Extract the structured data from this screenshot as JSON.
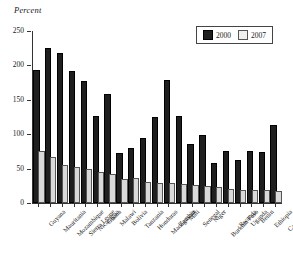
{
  "chart_data": {
    "type": "bar",
    "title": "",
    "ylabel": "Percent",
    "xlabel": "",
    "ylim": [
      0,
      250
    ],
    "yticks": [
      0,
      50,
      100,
      150,
      200,
      250
    ],
    "grid": false,
    "legend_position": "top-right",
    "categories": [
      "Guyana",
      "Mauritania",
      "Mozambique",
      "Sierra Leone",
      "Nicaragua",
      "Ghana",
      "Malawi",
      "Bolivia",
      "Tanzania",
      "Honduras",
      "Madagascar",
      "Zambia",
      "Mali",
      "Senegal",
      "Niger",
      "Burkina Faso",
      "Rwanda",
      "Uganda",
      "Benin",
      "Ethiopia",
      "Cameroon"
    ],
    "series": [
      {
        "name": "2000",
        "color": "#1f1f1f",
        "values": [
          190,
          222,
          215,
          189,
          175,
          123,
          155,
          70,
          77,
          91,
          122,
          176,
          124,
          83,
          96,
          55,
          73,
          60,
          72,
          71,
          110
        ]
      },
      {
        "name": "2007",
        "color": "#d9d9d9",
        "values": [
          72,
          64,
          53,
          50,
          46,
          42,
          39,
          32,
          33,
          27,
          26,
          26,
          25,
          24,
          22,
          20,
          17,
          16,
          16,
          16,
          15
        ]
      }
    ]
  },
  "legend": {
    "entries": [
      {
        "label": "2000",
        "swatch": "dark-swatch"
      },
      {
        "label": "2007",
        "swatch": "light-swatch"
      }
    ]
  }
}
